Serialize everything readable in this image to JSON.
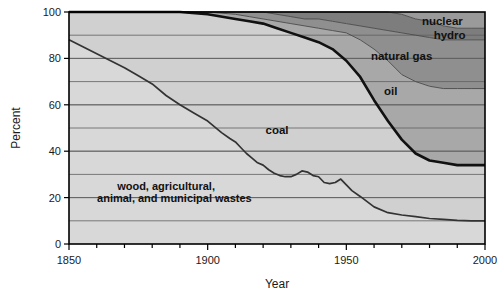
{
  "chart_data": {
    "type": "area",
    "title": "",
    "subtitle": "",
    "xlabel": "Year",
    "ylabel": "Percent",
    "xlim": [
      1850,
      2000
    ],
    "ylim": [
      0,
      100
    ],
    "xticks": [
      1850,
      1900,
      1950,
      2000
    ],
    "xtick_labels": [
      "1850",
      "1900",
      "1950",
      "2000"
    ],
    "xminor_step": 10,
    "yticks": [
      0,
      20,
      40,
      60,
      80,
      100
    ],
    "ytick_labels": [
      "0",
      "20",
      "40",
      "60",
      "80",
      "100"
    ],
    "ygrid_values": [
      10,
      20,
      30,
      40,
      50,
      60,
      70,
      80,
      90
    ],
    "grid": true,
    "legend_position": "in-plot-annotations",
    "stacking": "cumulative-from-bottom-to-100",
    "annotations": [
      {
        "name": "wood-wastes-label",
        "text": "wood, agricultural,",
        "x": 1885,
        "y": 25
      },
      {
        "name": "wood-wastes-label-line2",
        "text": "animal, and municipal wastes",
        "x": 1888,
        "y": 20
      },
      {
        "name": "coal-label",
        "text": "coal",
        "x": 1925,
        "y": 49
      },
      {
        "name": "oil-label",
        "text": "oil",
        "x": 1966,
        "y": 66
      },
      {
        "name": "natural-gas-label",
        "text": "natural gas",
        "x": 1981,
        "y": 81
      },
      {
        "name": "hydro-label",
        "text": "hydro",
        "x": 1993,
        "y": 90
      },
      {
        "name": "nuclear-label",
        "text": "nuclear",
        "x": 1992,
        "y": 96
      }
    ],
    "x": [
      1850,
      1860,
      1870,
      1880,
      1885,
      1890,
      1900,
      1910,
      1915,
      1920,
      1925,
      1930,
      1935,
      1940,
      1945,
      1950,
      1955,
      1960,
      1965,
      1970,
      1975,
      1980,
      1985,
      1990,
      1995,
      2000
    ],
    "series": [
      {
        "name": "wood, agricultural, animal, and municipal wastes",
        "color": "#d8d8d8",
        "cumulative_top": [
          88,
          82,
          76,
          69,
          64,
          60,
          53,
          44,
          38,
          34,
          30,
          29,
          31,
          29,
          26,
          23,
          19,
          16,
          14,
          13,
          12,
          11,
          11,
          10,
          10,
          10
        ]
      },
      {
        "name": "coal",
        "color": "#d0d0d0",
        "cumulative_top": [
          100,
          100,
          100,
          100,
          100,
          100,
          99,
          97,
          96,
          95,
          93,
          91,
          89,
          87,
          84,
          79,
          72,
          62,
          53,
          45,
          39,
          36,
          35,
          34,
          34,
          34
        ]
      },
      {
        "name": "oil",
        "color": "#a8a8a8",
        "cumulative_top": [
          100,
          100,
          100,
          100,
          100,
          100,
          100,
          99,
          98,
          97,
          96,
          95,
          94,
          93,
          92,
          91,
          88,
          84,
          79,
          73,
          70,
          68,
          67,
          67,
          67,
          67
        ]
      },
      {
        "name": "natural gas",
        "color": "#8f8f8f",
        "cumulative_top": [
          100,
          100,
          100,
          100,
          100,
          100,
          100,
          100,
          100,
          100,
          99,
          98,
          97,
          97,
          96,
          95,
          94,
          93,
          92,
          91,
          90,
          89,
          88,
          88,
          88,
          88
        ]
      },
      {
        "name": "hydro",
        "color": "#7d7d7d",
        "cumulative_top": [
          100,
          100,
          100,
          100,
          100,
          100,
          100,
          100,
          100,
          100,
          100,
          100,
          100,
          100,
          100,
          100,
          100,
          100,
          100,
          99,
          97,
          96,
          94,
          93,
          93,
          93
        ]
      },
      {
        "name": "nuclear",
        "color": "#9a9a9a",
        "cumulative_top": [
          100,
          100,
          100,
          100,
          100,
          100,
          100,
          100,
          100,
          100,
          100,
          100,
          100,
          100,
          100,
          100,
          100,
          100,
          100,
          100,
          100,
          100,
          100,
          100,
          100,
          100
        ]
      }
    ],
    "wood_detail_x": [
      1850,
      1855,
      1860,
      1865,
      1870,
      1875,
      1880,
      1885,
      1890,
      1895,
      1900,
      1905,
      1908,
      1910,
      1912,
      1914,
      1916,
      1918,
      1920,
      1922,
      1924,
      1926,
      1928,
      1930,
      1932,
      1934,
      1936,
      1938,
      1940,
      1942,
      1944,
      1946,
      1948,
      1950,
      1952,
      1955,
      1960,
      1965,
      1970,
      1975,
      1980,
      1985,
      1990,
      1995,
      2000
    ],
    "wood_detail_y": [
      88,
      85,
      82,
      79,
      76,
      72.5,
      69,
      64,
      60,
      56.5,
      53,
      48,
      45.5,
      44,
      41.5,
      39,
      37,
      35,
      34,
      32,
      30.5,
      29.5,
      29,
      29,
      30,
      31.5,
      31,
      29.5,
      29,
      26.5,
      26,
      26.5,
      28,
      25.5,
      23,
      20.5,
      16,
      13.5,
      12.5,
      11.8,
      11,
      10.6,
      10.2,
      10,
      10
    ]
  },
  "colors": {
    "plot_background": "#d2d2d2",
    "wood_band": "#d9d9d9",
    "coal_band": "#cfcfcf",
    "oil_band": "#a9a9a9",
    "gas_band": "#8e8e8e",
    "hydro_band": "#7c7c7c",
    "nuclear_band": "#999999",
    "grid_line": "#5f5f5f",
    "axis_line": "#000000",
    "coal_boundary": "#111111",
    "wood_boundary": "#333333",
    "text": "#1a1a1a"
  }
}
